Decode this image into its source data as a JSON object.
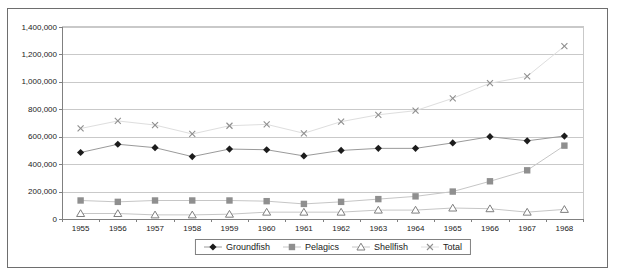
{
  "window": {
    "title": ""
  },
  "colors": {
    "background": "#ffffff",
    "frame_border": "#6e6e6e",
    "plot_border": "#c9c9c9",
    "gridline": "#c9c9c9",
    "axis_line": "#808080",
    "tick_text": "#1a1a1a"
  },
  "y_axis": {
    "tick_labels": [
      "0",
      "200,000",
      "400,000",
      "600,000",
      "800,000",
      "1,000,000",
      "1,200,000",
      "1,400,000"
    ]
  },
  "chart_data": {
    "type": "line",
    "title": "",
    "xlabel": "",
    "ylabel": "",
    "ylim": [
      0,
      1400000
    ],
    "ytick_step": 200000,
    "grid": true,
    "legend_position": "bottom",
    "categories": [
      "1955",
      "1956",
      "1957",
      "1958",
      "1959",
      "1960",
      "1961",
      "1962",
      "1963",
      "1964",
      "1965",
      "1966",
      "1967",
      "1968"
    ],
    "series": [
      {
        "name": "Groundfish",
        "marker": "diamond",
        "marker_color": "#1c1c1c",
        "line_color": "#9a9a9a",
        "values": [
          485000,
          545000,
          520000,
          455000,
          510000,
          505000,
          460000,
          500000,
          515000,
          515000,
          555000,
          600000,
          570000,
          605000
        ]
      },
      {
        "name": "Pelagics",
        "marker": "square",
        "marker_color": "#8f8f8f",
        "line_color": "#c6c6c6",
        "values": [
          135000,
          125000,
          135000,
          135000,
          135000,
          130000,
          110000,
          125000,
          145000,
          165000,
          200000,
          275000,
          355000,
          535000
        ]
      },
      {
        "name": "Shellfish",
        "marker": "triangle-open",
        "marker_color": "#7f7f7f",
        "line_color": "#c6c6c6",
        "values": [
          40000,
          40000,
          30000,
          30000,
          35000,
          50000,
          50000,
          50000,
          65000,
          65000,
          80000,
          75000,
          50000,
          70000
        ]
      },
      {
        "name": "Total",
        "marker": "x",
        "marker_color": "#8f8f8f",
        "line_color": "#dedede",
        "values": [
          660000,
          715000,
          685000,
          620000,
          680000,
          690000,
          625000,
          710000,
          760000,
          790000,
          880000,
          990000,
          1040000,
          1260000
        ]
      }
    ]
  }
}
